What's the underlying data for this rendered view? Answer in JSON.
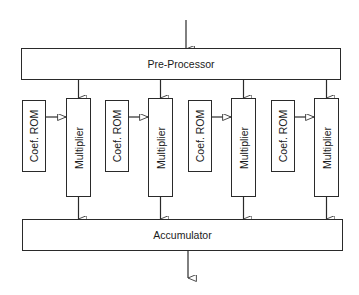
{
  "diagram": {
    "input_arrow": {
      "x": 186,
      "y1": 20,
      "y2": 49
    },
    "pre_processor": {
      "label": "Pre-Processor",
      "x": 21,
      "y": 48,
      "w": 320,
      "h": 32
    },
    "channels": [
      {
        "rom_label": "Coef. ROM",
        "mult_label": "Multiplier",
        "rom_x": 22,
        "mult_x": 66
      },
      {
        "rom_label": "Coef. ROM",
        "mult_label": "Multiplier",
        "rom_x": 105,
        "mult_x": 148
      },
      {
        "rom_label": "Coef. ROM",
        "mult_label": "Multiplier",
        "rom_x": 188,
        "mult_x": 231
      },
      {
        "rom_label": "Coef. ROM",
        "mult_label": "Multiplier",
        "rom_x": 271,
        "mult_x": 314
      }
    ],
    "rom_box": {
      "y": 100,
      "w": 24,
      "h": 72
    },
    "mult_box": {
      "y": 98,
      "w": 25,
      "h": 99
    },
    "accumulator": {
      "label": "Accumulator",
      "x": 22,
      "y": 219,
      "w": 321,
      "h": 32
    },
    "output_arrow": {
      "x": 188,
      "y1": 251,
      "y2": 278
    },
    "colors": {
      "line": "#2a2a2a",
      "background": "#ffffff"
    }
  }
}
